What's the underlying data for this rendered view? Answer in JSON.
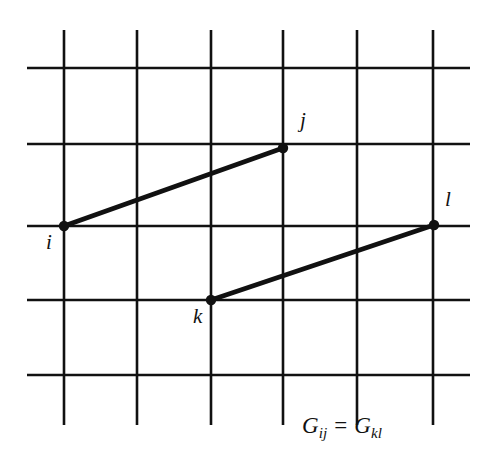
{
  "figure": {
    "kind": "lattice-vector-diagram",
    "background_color": "#ffffff",
    "ink_color": "#111111",
    "canvas": {
      "width": 485,
      "height": 470
    },
    "grid": {
      "line_color": "#111111",
      "line_width": 2.6,
      "vertical_x": [
        64,
        137,
        211,
        283,
        357,
        433
      ],
      "vertical_y_start": 30,
      "vertical_y_end": 425,
      "horizontal_y": [
        68,
        144,
        226,
        300,
        375
      ],
      "horizontal_x_start": 27,
      "horizontal_x_end": 470,
      "columns": 6,
      "rows": 5
    },
    "nodes": [
      {
        "id": "i",
        "label": "i",
        "x": 64,
        "y": 226,
        "label_x": 46,
        "label_y": 232,
        "radius": 5.2
      },
      {
        "id": "j",
        "label": "j",
        "x": 283,
        "y": 148,
        "label_x": 300,
        "label_y": 110,
        "radius": 5.2
      },
      {
        "id": "k",
        "label": "k",
        "x": 211,
        "y": 300,
        "label_x": 193,
        "label_y": 306,
        "radius": 5.2
      },
      {
        "id": "l",
        "label": "l",
        "x": 434,
        "y": 225,
        "label_x": 445,
        "label_y": 189,
        "radius": 5.2
      }
    ],
    "edges": [
      {
        "id": "edge-ij",
        "from": "i",
        "to": "j",
        "x1": 64,
        "y1": 226,
        "x2": 283,
        "y2": 148,
        "width": 4.6
      },
      {
        "id": "edge-kl",
        "from": "k",
        "to": "l",
        "x1": 211,
        "y1": 300,
        "x2": 434,
        "y2": 225,
        "width": 4.6
      }
    ],
    "equation": {
      "left_symbol": "G",
      "left_subscript": "ij",
      "relation": "=",
      "right_symbol": "G",
      "right_subscript": "kl",
      "plain_text": "G_ij = G_kl"
    }
  }
}
